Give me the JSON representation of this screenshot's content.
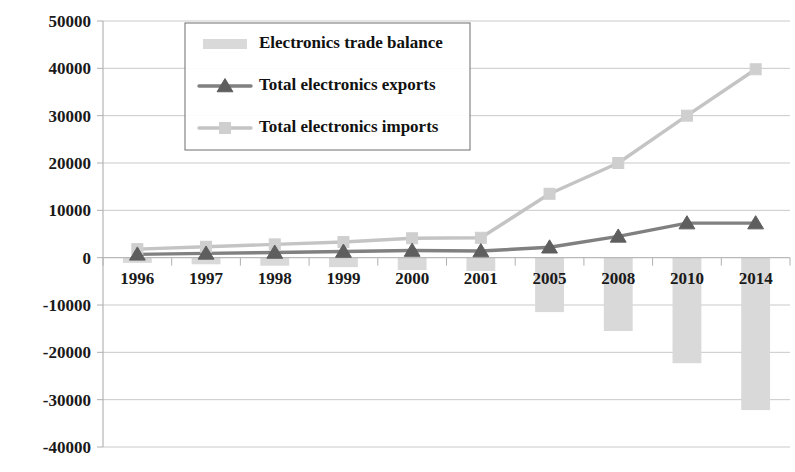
{
  "chart_data": {
    "type": "bar",
    "title": "",
    "xlabel": "",
    "ylabel": "",
    "ylim": [
      -40000,
      50000
    ],
    "ytick_step": 10000,
    "grid": true,
    "legend_position": "top-center",
    "categories": [
      "1996",
      "1997",
      "1998",
      "1999",
      "2000",
      "2001",
      "2005",
      "2008",
      "2010",
      "2014"
    ],
    "ytick_labels": [
      "50000",
      "40000",
      "30000",
      "20000",
      "10000",
      "0",
      "-10000",
      "-20000",
      "-30000",
      "-40000"
    ],
    "series": [
      {
        "name": "Electronics trade balance",
        "type": "bar",
        "color": "#d9d9d9",
        "values": [
          -1100,
          -1400,
          -1700,
          -2000,
          -2600,
          -2800,
          -11500,
          -15500,
          -22300,
          -32200
        ]
      },
      {
        "name": "Total electronics exports",
        "type": "line",
        "marker": "triangle",
        "color": "#808080",
        "marker_color": "#5e5e5e",
        "values": [
          700,
          900,
          1100,
          1300,
          1500,
          1400,
          2200,
          4500,
          7300,
          7300
        ]
      },
      {
        "name": "Total electronics imports",
        "type": "line",
        "marker": "square",
        "color": "#c4c4c4",
        "marker_color": "#cfcfcf",
        "values": [
          1800,
          2300,
          2800,
          3300,
          4100,
          4200,
          13500,
          20000,
          30000,
          39800
        ]
      }
    ]
  },
  "legend": {
    "items": [
      {
        "label": "Electronics trade balance",
        "swatch": "bar-swatch"
      },
      {
        "label": "Total electronics exports",
        "swatch": "line-triangle-swatch"
      },
      {
        "label": "Total electronics imports",
        "swatch": "line-square-swatch"
      }
    ]
  },
  "colors": {
    "bar": "#d9d9d9",
    "exports_line": "#808080",
    "exports_marker": "#5e5e5e",
    "imports_line": "#c4c4c4",
    "imports_marker": "#cfcfcf",
    "grid": "#c9c9c9",
    "text": "#1a1a1a"
  }
}
